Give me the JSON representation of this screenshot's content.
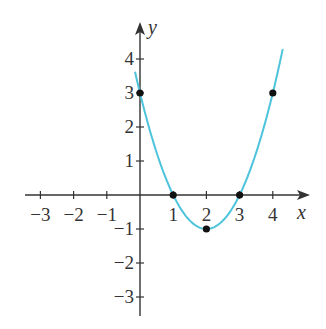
{
  "chart_data": {
    "type": "line",
    "title": "",
    "xlabel": "x",
    "ylabel": "y",
    "xlim": [
      -3.4,
      5.0
    ],
    "ylim": [
      -3.6,
      4.5
    ],
    "grid": false,
    "legend": null,
    "x_ticks": [
      -3,
      -2,
      -1,
      1,
      2,
      3,
      4
    ],
    "x_tick_labels": [
      "−3",
      "−2",
      "−1",
      "1",
      "2",
      "3",
      "4"
    ],
    "y_ticks": [
      4,
      3,
      2,
      1,
      -1,
      -2,
      -3
    ],
    "y_tick_labels": [
      "4",
      "3",
      "2",
      "1",
      "−1",
      "−2",
      "−3"
    ],
    "series": [
      {
        "name": "curve",
        "kind": "line",
        "color": "#4ec3dc",
        "function": "x^2 - 4x + 3",
        "x_range": [
          -0.15,
          4.3
        ]
      },
      {
        "name": "points",
        "kind": "scatter",
        "color": "#111111",
        "x": [
          0,
          1,
          2,
          3,
          4
        ],
        "y": [
          3,
          0,
          -1,
          0,
          3
        ]
      }
    ]
  },
  "colors": {
    "axis": "#333333",
    "curve": "#4ec3dc",
    "point": "#111111"
  }
}
